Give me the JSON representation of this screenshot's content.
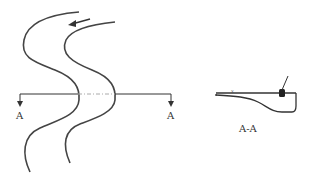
{
  "diagram": {
    "type": "channel plan view with section cut",
    "plan_view": {
      "description": "Meandering channel with two banks and flow direction arrow",
      "flow_arrow": "flow-direction",
      "section_line": {
        "left_label": "A",
        "right_label": "A"
      }
    },
    "section_view": {
      "title": "A-A",
      "description": "Cross-section of channel showing asymmetric bed profile with marker"
    },
    "colors": {
      "line": "#333333",
      "centerline": "#aaaaaa",
      "background": "#ffffff"
    }
  }
}
